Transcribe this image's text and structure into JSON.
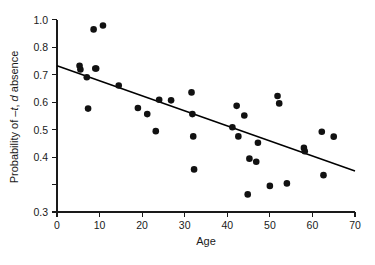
{
  "chart_data": {
    "type": "scatter",
    "title": "",
    "xlabel": "Age",
    "ylabel": "Probability of –t, d absence",
    "ylabel_parts": {
      "prefix": "Probability of –",
      "italic1": "t",
      "middle": ", ",
      "italic2": "d",
      "suffix": " absence"
    },
    "xlim": [
      0,
      70
    ],
    "ylim": [
      0.3,
      1.0
    ],
    "xticks": [
      0,
      10,
      20,
      30,
      40,
      50,
      60,
      70
    ],
    "xtick_labels": [
      "0",
      "10",
      "20",
      "30",
      "40",
      "50",
      "60",
      "70"
    ],
    "yticks": [
      0.3,
      0.4,
      0.5,
      0.6,
      0.7,
      0.8,
      0.9,
      1.0
    ],
    "ytick_labels": [
      "0.3",
      "0.4",
      "0.5",
      "0.6",
      "0.7",
      "0.8",
      "0.9",
      "1.0"
    ],
    "ytick_labels_shown": [
      "0.3",
      "0.4",
      "0.5",
      "0.6",
      "0.7",
      "0.8",
      "1.0"
    ],
    "grid": false,
    "legend": null,
    "marker": {
      "shape": "circle",
      "color": "#111111",
      "size_px": 4.6
    },
    "x": [
      5.3,
      5.5,
      7.0,
      7.3,
      8.6,
      9.0,
      9.2,
      10.8,
      14.5,
      19.0,
      21.2,
      23.2,
      24.0,
      26.8,
      31.6,
      31.8,
      32.0,
      32.2,
      41.2,
      42.2,
      42.6,
      44.0,
      44.8,
      45.2,
      46.8,
      47.2,
      50.0,
      51.8,
      52.2,
      54.0,
      58.0,
      58.2,
      62.2,
      62.6,
      65.0
    ],
    "y": [
      0.832,
      0.818,
      0.79,
      0.676,
      0.964,
      0.822,
      0.822,
      0.978,
      0.76,
      0.678,
      0.656,
      0.594,
      0.708,
      0.706,
      0.735,
      0.656,
      0.575,
      0.455,
      0.608,
      0.686,
      0.575,
      0.651,
      0.364,
      0.494,
      0.483,
      0.552,
      0.395,
      0.722,
      0.695,
      0.404,
      0.533,
      0.521,
      0.592,
      0.434,
      0.574
    ],
    "points": [
      {
        "x": 5.3,
        "y": 0.832
      },
      {
        "x": 5.5,
        "y": 0.818
      },
      {
        "x": 7.0,
        "y": 0.79
      },
      {
        "x": 7.3,
        "y": 0.676
      },
      {
        "x": 8.6,
        "y": 0.964
      },
      {
        "x": 9.0,
        "y": 0.822
      },
      {
        "x": 9.2,
        "y": 0.822
      },
      {
        "x": 10.8,
        "y": 0.978
      },
      {
        "x": 14.5,
        "y": 0.76
      },
      {
        "x": 19.0,
        "y": 0.678
      },
      {
        "x": 21.2,
        "y": 0.656
      },
      {
        "x": 23.2,
        "y": 0.594
      },
      {
        "x": 24.0,
        "y": 0.708
      },
      {
        "x": 26.8,
        "y": 0.706
      },
      {
        "x": 31.6,
        "y": 0.735
      },
      {
        "x": 31.8,
        "y": 0.656
      },
      {
        "x": 32.0,
        "y": 0.575
      },
      {
        "x": 32.2,
        "y": 0.455
      },
      {
        "x": 41.2,
        "y": 0.608
      },
      {
        "x": 42.2,
        "y": 0.686
      },
      {
        "x": 42.6,
        "y": 0.575
      },
      {
        "x": 44.0,
        "y": 0.651
      },
      {
        "x": 44.8,
        "y": 0.364
      },
      {
        "x": 45.2,
        "y": 0.494
      },
      {
        "x": 46.8,
        "y": 0.483
      },
      {
        "x": 47.2,
        "y": 0.552
      },
      {
        "x": 50.0,
        "y": 0.395
      },
      {
        "x": 51.8,
        "y": 0.722
      },
      {
        "x": 52.2,
        "y": 0.695
      },
      {
        "x": 54.0,
        "y": 0.404
      },
      {
        "x": 58.0,
        "y": 0.533
      },
      {
        "x": 58.2,
        "y": 0.521
      },
      {
        "x": 62.2,
        "y": 0.592
      },
      {
        "x": 62.6,
        "y": 0.434
      },
      {
        "x": 65.0,
        "y": 0.574
      }
    ],
    "fit_line": {
      "type": "linear-regression",
      "x_start": 0,
      "y_start": 0.832,
      "x_end": 70,
      "y_end": 0.449,
      "intercept": 0.832,
      "slope": -0.00547
    }
  }
}
